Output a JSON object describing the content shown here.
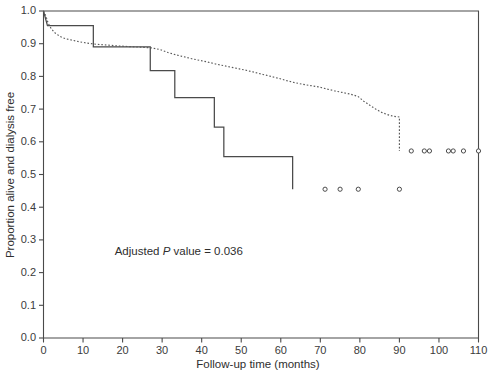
{
  "chart_data": {
    "type": "line",
    "title": "",
    "xlabel": "Follow-up time (months)",
    "ylabel": "Proportion alive and dialysis free",
    "xlim": [
      0,
      110
    ],
    "ylim": [
      0.0,
      1.0
    ],
    "xticks": [
      0,
      10,
      20,
      30,
      40,
      50,
      60,
      70,
      80,
      90,
      100,
      110
    ],
    "xtick_labels": [
      "0",
      "10",
      "20",
      "30",
      "40",
      "50",
      "60",
      "70",
      "80",
      "90",
      "100",
      "110"
    ],
    "yticks": [
      0.0,
      0.1,
      0.2,
      0.3,
      0.4,
      0.5,
      0.6,
      0.7,
      0.8,
      0.9,
      1.0
    ],
    "ytick_labels": [
      "0.0",
      "0.1",
      "0.2",
      "0.3",
      "0.4",
      "0.5",
      "0.6",
      "0.7",
      "0.8",
      "0.9",
      "1.0"
    ],
    "grid": false,
    "legend": null,
    "annotations": [
      {
        "name": "adjusted-p-value",
        "prefix": "Adjusted ",
        "italic": "P",
        "suffix": " value = 0.036",
        "x": 18,
        "y": 0.255
      }
    ],
    "series": [
      {
        "name": "solid-step-curve",
        "style": "solid",
        "step": true,
        "points": [
          [
            0,
            1.0
          ],
          [
            1.0,
            0.955
          ],
          [
            12.6,
            0.955
          ],
          [
            12.6,
            0.89
          ],
          [
            27.0,
            0.89
          ],
          [
            27.0,
            0.818
          ],
          [
            33.2,
            0.818
          ],
          [
            33.2,
            0.735
          ],
          [
            43.2,
            0.735
          ],
          [
            43.2,
            0.645
          ],
          [
            45.6,
            0.645
          ],
          [
            45.6,
            0.555
          ],
          [
            63.0,
            0.555
          ],
          [
            63.0,
            0.455
          ]
        ]
      },
      {
        "name": "dotted-step-curve",
        "style": "dotted",
        "step": true,
        "points": [
          [
            0,
            1.0
          ],
          [
            0.6,
            0.985
          ],
          [
            1.2,
            0.962
          ],
          [
            2.0,
            0.945
          ],
          [
            3.0,
            0.932
          ],
          [
            4.2,
            0.922
          ],
          [
            5.6,
            0.915
          ],
          [
            7.2,
            0.911
          ],
          [
            9.0,
            0.906
          ],
          [
            11.0,
            0.902
          ],
          [
            13.5,
            0.898
          ],
          [
            16.0,
            0.896
          ],
          [
            19.0,
            0.893
          ],
          [
            22.0,
            0.891
          ],
          [
            25.0,
            0.889
          ],
          [
            27.5,
            0.887
          ],
          [
            29.5,
            0.882
          ],
          [
            31.5,
            0.873
          ],
          [
            33.5,
            0.866
          ],
          [
            35.5,
            0.86
          ],
          [
            37.5,
            0.854
          ],
          [
            39.5,
            0.849
          ],
          [
            41.5,
            0.844
          ],
          [
            43.5,
            0.838
          ],
          [
            45.5,
            0.833
          ],
          [
            47.5,
            0.828
          ],
          [
            49.5,
            0.823
          ],
          [
            51.5,
            0.818
          ],
          [
            53.5,
            0.812
          ],
          [
            55.5,
            0.806
          ],
          [
            57.5,
            0.8
          ],
          [
            59.5,
            0.794
          ],
          [
            61.5,
            0.787
          ],
          [
            63.5,
            0.781
          ],
          [
            65.5,
            0.776
          ],
          [
            67.5,
            0.772
          ],
          [
            69.5,
            0.768
          ],
          [
            71.5,
            0.762
          ],
          [
            73.5,
            0.756
          ],
          [
            75.5,
            0.751
          ],
          [
            77.5,
            0.746
          ],
          [
            79.5,
            0.739
          ],
          [
            81.0,
            0.724
          ],
          [
            82.5,
            0.712
          ],
          [
            84.0,
            0.7
          ],
          [
            85.5,
            0.69
          ],
          [
            87.0,
            0.683
          ],
          [
            88.5,
            0.678
          ],
          [
            90.0,
            0.676
          ],
          [
            90.0,
            0.572
          ]
        ]
      }
    ],
    "censor_marks": [
      {
        "group": "dotted-step-curve",
        "x": 93.0,
        "y": 0.572
      },
      {
        "group": "dotted-step-curve",
        "x": 96.3,
        "y": 0.572
      },
      {
        "group": "dotted-step-curve",
        "x": 97.6,
        "y": 0.572
      },
      {
        "group": "dotted-step-curve",
        "x": 102.4,
        "y": 0.572
      },
      {
        "group": "dotted-step-curve",
        "x": 103.6,
        "y": 0.572
      },
      {
        "group": "dotted-step-curve",
        "x": 106.2,
        "y": 0.572
      },
      {
        "group": "dotted-step-curve",
        "x": 110.0,
        "y": 0.572
      },
      {
        "group": "solid-step-curve",
        "x": 71.2,
        "y": 0.455
      },
      {
        "group": "solid-step-curve",
        "x": 75.0,
        "y": 0.455
      },
      {
        "group": "solid-step-curve",
        "x": 79.6,
        "y": 0.455
      },
      {
        "group": "solid-step-curve",
        "x": 90.0,
        "y": 0.455
      }
    ]
  }
}
